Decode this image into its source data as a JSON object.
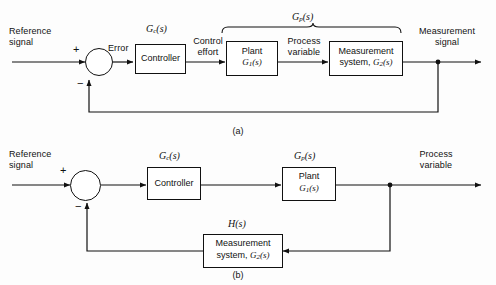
{
  "figure": {
    "background": "#fdfdfd",
    "line_color": "#111111"
  },
  "diagram_a": {
    "caption": "(a)",
    "input_label_line1": "Reference",
    "input_label_line2": "signal",
    "sum_plus": "+",
    "sum_minus": "−",
    "error_label": "Error",
    "controller_tf": "G",
    "controller_tf_sub": "c",
    "controller_tf_arg": "(s)",
    "controller_label": "Controller",
    "control_effort_line1": "Control",
    "control_effort_line2": "effort",
    "plant_label": "Plant",
    "plant_tf": "G",
    "plant_tf_sub": "1",
    "plant_tf_arg": "(s)",
    "process_variable_line1": "Process",
    "process_variable_line2": "variable",
    "measurement_label": "Measurement",
    "measurement_tf_prefix": "system, ",
    "measurement_tf": "G",
    "measurement_tf_sub": "2",
    "measurement_tf_arg": "(s)",
    "brace_tf": "G",
    "brace_tf_sub": "p",
    "brace_tf_arg": "(s)",
    "output_label_line1": "Measurement",
    "output_label_line2": "signal"
  },
  "diagram_b": {
    "caption": "(b)",
    "input_label_line1": "Reference",
    "input_label_line2": "signal",
    "sum_plus": "+",
    "sum_minus": "−",
    "controller_tf": "G",
    "controller_tf_sub": "c",
    "controller_tf_arg": "(s)",
    "controller_label": "Controller",
    "plant_tf": "G",
    "plant_tf_sub": "p",
    "plant_tf_arg": "(s)",
    "plant_label": "Plant",
    "plant_inner_tf": "G",
    "plant_inner_tf_sub": "1",
    "plant_inner_tf_arg": "(s)",
    "feedback_tf": "H",
    "feedback_tf_arg": "(s)",
    "measurement_label": "Measurement",
    "measurement_tf_prefix": "system, ",
    "measurement_tf": "G",
    "measurement_tf_sub": "2",
    "measurement_tf_arg": "(s)",
    "output_label_line1": "Process",
    "output_label_line2": "variable"
  }
}
